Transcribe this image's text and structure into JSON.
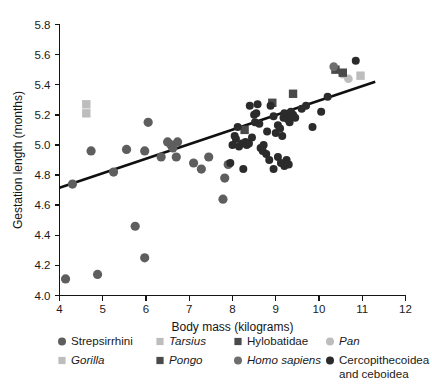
{
  "figure": {
    "background": "#ffffff",
    "title": ""
  },
  "axes": {
    "x": {
      "label": "Body mass (kilograms)",
      "ticks": [
        4,
        5,
        6,
        7,
        8,
        9,
        10,
        11,
        12
      ],
      "tick_labels": [
        "4",
        "5",
        "6",
        "7",
        "8",
        "9",
        "10",
        "11",
        "12"
      ],
      "min": 4,
      "max": 12
    },
    "y": {
      "label": "Gestation length (months)",
      "ticks": [
        4.0,
        4.2,
        4.4,
        4.6,
        4.8,
        5.0,
        5.2,
        5.4,
        5.6,
        5.8
      ],
      "tick_labels": [
        "4.0",
        "4.2",
        "4.4",
        "4.6",
        "4.8",
        "5.0",
        "5.2",
        "5.4",
        "5.6",
        "5.8"
      ],
      "min": 4.0,
      "max": 5.8
    },
    "grid": false,
    "frame": "left-bottom"
  },
  "colors": {
    "strepsirrhini": "#5e5e5e",
    "tarsius": "#bdbdbd",
    "gorilla": "#bdbdbd",
    "pongo": "#4a4a4a",
    "hylobatidae": "#4a4a4a",
    "homo_sapiens": "#6e6e6e",
    "cercopithecoidea": "#2b2b2b",
    "regression_line": "#101010",
    "axis": "#141414",
    "text": "#1a1a1a"
  },
  "legend": {
    "position": "below-axis",
    "entries": [
      {
        "label": "Strepsirrhini",
        "marker": "circle",
        "color": "#5e5e5e",
        "italic": false,
        "size": 6.2
      },
      {
        "label": "Tarsius",
        "marker": "square",
        "color": "#bdbdbd",
        "italic": true,
        "size": 5.6
      },
      {
        "label": "Hylobatidae",
        "marker": "square",
        "color": "#4a4a4a",
        "italic": false,
        "size": 5.6
      },
      {
        "label": "Pan",
        "marker": "circle",
        "color": "#bdbdbd",
        "italic": true,
        "size": 5.6
      },
      {
        "label": "Gorilla",
        "marker": "square",
        "color": "#bdbdbd",
        "italic": true,
        "size": 5.6
      },
      {
        "label": "Pongo",
        "marker": "square",
        "color": "#4a4a4a",
        "italic": true,
        "size": 5.6
      },
      {
        "label": "Homo sapiens",
        "marker": "circle",
        "color": "#6e6e6e",
        "italic": true,
        "size": 5.6
      },
      {
        "label": "Cercopithecoidea",
        "label_line2": "and ceboidea",
        "marker": "circle",
        "color": "#2b2b2b",
        "italic": false,
        "size": 5.6
      }
    ]
  },
  "chart_data": {
    "type": "scatter",
    "title": "",
    "xlabel": "Body mass (kilograms)",
    "ylabel": "Gestation length (months)",
    "xlim": [
      4,
      12
    ],
    "ylim": [
      4.0,
      5.8
    ],
    "grid": false,
    "legend_position": "below",
    "regression_line": {
      "x": [
        4.0,
        11.3
      ],
      "y": [
        4.715,
        5.42
      ],
      "slope": 0.0966,
      "intercept": 4.329,
      "color": "#101010",
      "width": 2.6
    },
    "series": [
      {
        "name": "Strepsirrhini",
        "marker": "circle",
        "color": "#5e5e5e",
        "points": [
          [
            4.14,
            4.11
          ],
          [
            4.88,
            4.14
          ],
          [
            5.75,
            4.46
          ],
          [
            5.97,
            4.25
          ],
          [
            4.3,
            4.74
          ],
          [
            4.73,
            4.96
          ],
          [
            5.25,
            4.82
          ],
          [
            5.97,
            4.96
          ],
          [
            6.05,
            5.15
          ],
          [
            6.5,
            5.02
          ],
          [
            6.58,
            5.0
          ],
          [
            6.62,
            4.98
          ],
          [
            6.7,
            4.92
          ],
          [
            6.73,
            5.02
          ],
          [
            7.1,
            4.88
          ],
          [
            7.28,
            4.84
          ],
          [
            7.45,
            4.92
          ],
          [
            7.78,
            4.64
          ],
          [
            7.82,
            4.78
          ],
          [
            7.9,
            4.87
          ],
          [
            6.35,
            4.92
          ],
          [
            5.55,
            4.97
          ]
        ]
      },
      {
        "name": "Tarsius",
        "marker": "square",
        "color": "#bdbdbd",
        "points": [
          [
            4.62,
            5.27
          ],
          [
            4.62,
            5.21
          ]
        ]
      },
      {
        "name": "Hylobatidae",
        "marker": "square",
        "color": "#4a4a4a",
        "points": [
          [
            8.28,
            5.1
          ],
          [
            8.92,
            5.28
          ],
          [
            9.4,
            5.34
          ]
        ]
      },
      {
        "name": "Pan",
        "marker": "circle",
        "color": "#bdbdbd",
        "points": [
          [
            10.55,
            5.47
          ],
          [
            10.68,
            5.44
          ]
        ]
      },
      {
        "name": "Gorilla",
        "marker": "square",
        "color": "#bdbdbd",
        "points": [
          [
            10.96,
            5.46
          ]
        ]
      },
      {
        "name": "Pongo",
        "marker": "square",
        "color": "#4a4a4a",
        "points": [
          [
            10.38,
            5.5
          ],
          [
            10.55,
            5.48
          ]
        ]
      },
      {
        "name": "Homo sapiens",
        "marker": "circle",
        "color": "#6e6e6e",
        "points": [
          [
            10.34,
            5.52
          ]
        ]
      },
      {
        "name": "Cercopithecoidea and ceboidea",
        "marker": "circle",
        "color": "#2b2b2b",
        "points": [
          [
            8.0,
            5.0
          ],
          [
            8.05,
            5.06
          ],
          [
            8.08,
            5.04
          ],
          [
            8.12,
            5.12
          ],
          [
            8.15,
            4.99
          ],
          [
            8.22,
            5.01
          ],
          [
            8.3,
            5.02
          ],
          [
            8.33,
            5.0
          ],
          [
            8.38,
            5.01
          ],
          [
            8.4,
            5.26
          ],
          [
            8.45,
            5.05
          ],
          [
            8.5,
            5.2
          ],
          [
            8.52,
            5.15
          ],
          [
            8.55,
            5.21
          ],
          [
            8.58,
            5.27
          ],
          [
            8.62,
            5.14
          ],
          [
            8.65,
            4.98
          ],
          [
            8.7,
            4.96
          ],
          [
            8.72,
            5.0
          ],
          [
            8.78,
            4.94
          ],
          [
            8.8,
            5.09
          ],
          [
            8.85,
            4.9
          ],
          [
            8.88,
            5.26
          ],
          [
            8.95,
            5.19
          ],
          [
            9.0,
            5.08
          ],
          [
            9.05,
            5.13
          ],
          [
            9.1,
            5.11
          ],
          [
            9.15,
            5.06
          ],
          [
            9.18,
            5.18
          ],
          [
            9.2,
            5.21
          ],
          [
            9.25,
            5.19
          ],
          [
            9.28,
            5.17
          ],
          [
            9.32,
            5.15
          ],
          [
            9.35,
            5.22
          ],
          [
            9.4,
            5.2
          ],
          [
            9.45,
            5.18
          ],
          [
            9.05,
            4.92
          ],
          [
            9.12,
            4.88
          ],
          [
            9.2,
            4.86
          ],
          [
            9.25,
            4.9
          ],
          [
            9.3,
            4.87
          ],
          [
            8.95,
            4.84
          ],
          [
            8.25,
            4.84
          ],
          [
            7.95,
            4.88
          ],
          [
            9.85,
            5.12
          ],
          [
            10.05,
            5.22
          ],
          [
            10.85,
            5.56
          ],
          [
            10.2,
            5.32
          ],
          [
            9.6,
            5.24
          ],
          [
            9.7,
            5.26
          ]
        ]
      }
    ]
  }
}
